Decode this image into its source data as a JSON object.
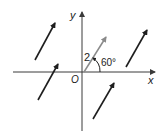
{
  "diagram": {
    "type": "vector-plane",
    "axes": {
      "x_label": "x",
      "y_label": "y",
      "origin_label": "O"
    },
    "reference_vector": {
      "magnitude_label": "2",
      "angle_label": "60°",
      "color": "#8a8a8a"
    },
    "parallel_vectors_count": 4,
    "colors": {
      "axes": "#3a3a3a",
      "vectors": "#1e1e1e",
      "reference": "#8a8a8a"
    }
  }
}
